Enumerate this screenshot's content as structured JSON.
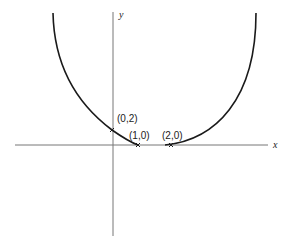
{
  "diagram": {
    "type": "curve-sketch",
    "axes": {
      "x_label": "x",
      "y_label": "y"
    },
    "points": [
      {
        "label": "(0,2)",
        "x": 0,
        "y": 2,
        "marker": "x"
      },
      {
        "label": "(1,0)",
        "x": 1,
        "y": 0,
        "marker": "x"
      },
      {
        "label": "(2,0)",
        "x": 2,
        "y": 0,
        "marker": "x"
      }
    ],
    "curves": [
      {
        "name": "left-branch",
        "description": "descends from upper left through (0,2) to (1,0)"
      },
      {
        "name": "right-branch",
        "description": "rises from (2,0) to upper right"
      }
    ],
    "colors": {
      "stroke": "#1a1a1a",
      "axis": "#555555",
      "background": "#ffffff"
    }
  }
}
